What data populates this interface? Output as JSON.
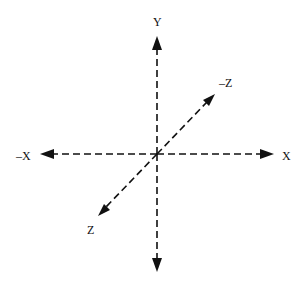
{
  "diagram": {
    "title": "",
    "origin": {
      "x": 157,
      "y": 154
    },
    "axes": [
      {
        "id": "y-pos",
        "label": "Y"
      },
      {
        "id": "y-neg",
        "label": ""
      },
      {
        "id": "x-pos",
        "label": "X"
      },
      {
        "id": "x-neg",
        "label": "–X"
      },
      {
        "id": "z-neg",
        "label": "–Z"
      },
      {
        "id": "z-pos",
        "label": "Z"
      }
    ],
    "line_style": "dashed",
    "color": "#111111"
  }
}
